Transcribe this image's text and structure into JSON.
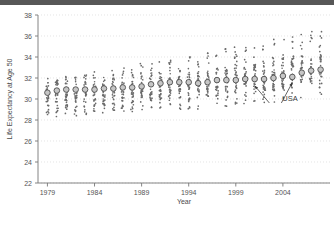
{
  "chart_data": {
    "type": "scatter",
    "title": "",
    "xlabel": "Year",
    "ylabel": "Life Expectancy at Age 50",
    "xlim": [
      1978,
      2009
    ],
    "ylim": [
      22,
      38
    ],
    "xticks": [
      1979,
      1984,
      1989,
      1994,
      1999,
      2004
    ],
    "yticks": [
      22,
      24,
      26,
      28,
      30,
      32,
      34,
      36,
      38
    ],
    "grid": true,
    "legend_position": "none",
    "annotations": [
      {
        "text": "USA",
        "x": 2003.2,
        "y": 29.05,
        "points_to": [
          [
            2001.0,
            31.6
          ],
          [
            2005.0,
            31.9
          ]
        ]
      }
    ],
    "series": [
      {
        "name": "USA",
        "marker": "large-open-circle",
        "x": [
          1979,
          1980,
          1981,
          1982,
          1983,
          1984,
          1985,
          1986,
          1987,
          1988,
          1989,
          1990,
          1991,
          1992,
          1993,
          1994,
          1995,
          1996,
          1997,
          1998,
          1999,
          2000,
          2001,
          2002,
          2003,
          2004,
          2005,
          2006,
          2007,
          2008
        ],
        "values": [
          30.6,
          30.8,
          30.9,
          30.9,
          30.9,
          30.9,
          31.0,
          31.0,
          31.1,
          31.1,
          31.2,
          31.4,
          31.5,
          31.6,
          31.6,
          31.6,
          31.5,
          31.6,
          31.8,
          31.8,
          31.8,
          31.9,
          31.9,
          31.9,
          32.0,
          32.2,
          32.1,
          32.5,
          32.7,
          32.8
        ]
      },
      {
        "name": "Other countries (small dots)",
        "marker": "small-dot",
        "x": [
          1979,
          1980,
          1981,
          1982,
          1983,
          1984,
          1985,
          1986,
          1987,
          1988,
          1989,
          1990,
          1991,
          1992,
          1993,
          1994,
          1995,
          1996,
          1997,
          1998,
          1999,
          2000,
          2001,
          2002,
          2003,
          2004,
          2005,
          2006,
          2007,
          2008
        ],
        "spread_min": [
          27.9,
          28.0,
          28.2,
          28.4,
          28.4,
          28.6,
          28.6,
          28.7,
          28.8,
          28.8,
          28.9,
          29.0,
          29.0,
          29.0,
          28.9,
          29.0,
          29.0,
          29.2,
          29.3,
          29.3,
          29.4,
          29.4,
          29.5,
          29.6,
          29.7,
          29.8,
          29.9,
          30.0,
          30.2,
          30.3
        ],
        "spread_max": [
          32.0,
          32.1,
          32.2,
          32.3,
          32.5,
          32.6,
          32.7,
          32.8,
          33.0,
          33.2,
          33.4,
          33.5,
          33.7,
          33.8,
          33.9,
          34.1,
          34.3,
          34.5,
          34.6,
          34.8,
          35.0,
          35.2,
          35.3,
          35.5,
          35.7,
          35.9,
          36.1,
          36.3,
          36.5,
          36.7
        ]
      }
    ]
  },
  "labels": {
    "xlabel": "Year",
    "ylabel": "Life Expectancy at Age 50",
    "usa_annotation": "USA"
  }
}
